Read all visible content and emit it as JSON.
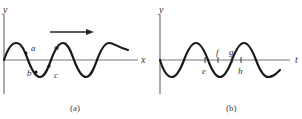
{
  "panel_a": {
    "y_axis_label": "y",
    "x_axis_label": "x",
    "caption": "(a)",
    "points": [
      {
        "label": "a",
        "x": 32,
        "y": 47
      },
      {
        "label": "b",
        "x": 36,
        "y": 70
      },
      {
        "label": "c",
        "x": 51,
        "y": 71
      },
      {
        "label": "d",
        "x": 58,
        "y": 45
      }
    ],
    "arrow_direction": "right",
    "description": "Transverse wave snapshot y vs x traveling to the right"
  },
  "panel_b": {
    "y_axis_label": "y",
    "x_axis_label": "t",
    "caption": "(b)",
    "ticks": [
      {
        "label": "e",
        "x": 205
      },
      {
        "label": "f",
        "x": 219
      },
      {
        "label": "g",
        "x": 232
      },
      {
        "label": "h",
        "x": 241
      }
    ],
    "description": "Displacement y vs time t at a fixed point"
  },
  "colors": {
    "wave": "#1a1a1a",
    "axis": "#555555",
    "background": "#ffffff"
  }
}
